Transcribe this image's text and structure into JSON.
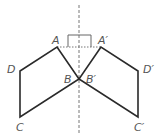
{
  "diagram": {
    "type": "reflection",
    "colors": {
      "shape": "#2a2a2a",
      "axis": "#777777",
      "label": "#555555"
    },
    "points": {
      "A": {
        "label": "A",
        "x": 57,
        "y": 47
      },
      "B": {
        "label": "B",
        "x": 79,
        "y": 79
      },
      "C": {
        "label": "C",
        "x": 20,
        "y": 117
      },
      "D": {
        "label": "D",
        "x": 20,
        "y": 71
      },
      "A'": {
        "label": "A′",
        "x": 101,
        "y": 47
      },
      "B'": {
        "label": "B′",
        "x": 79,
        "y": 79
      },
      "C'": {
        "label": "C′",
        "x": 138,
        "y": 117
      },
      "D'": {
        "label": "D′",
        "x": 138,
        "y": 71
      }
    },
    "labels": {
      "A": "A",
      "B": "B",
      "C": "C",
      "D": "D",
      "A_prime": "A′",
      "B_prime": "B′",
      "C_prime": "C′",
      "D_prime": "D′"
    },
    "axis": {
      "x": 79,
      "y1": 5,
      "y2": 135,
      "style": "dashed"
    },
    "segment_AA_prime": {
      "style": "dotted"
    },
    "right_angle_marker": true
  }
}
